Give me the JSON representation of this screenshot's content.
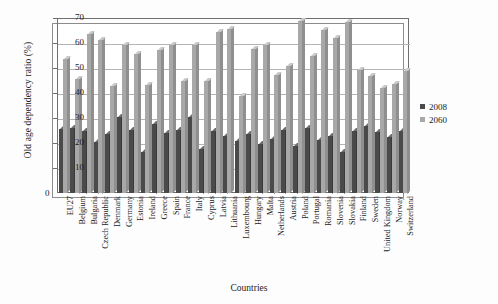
{
  "chart_data": {
    "type": "bar",
    "title": "",
    "xlabel": "Countries",
    "ylabel": "Old age dependency ratio (%)",
    "ylim": [
      0,
      70
    ],
    "ytick_step": 10,
    "yticks": [
      0,
      10,
      20,
      30,
      40,
      50,
      60,
      70
    ],
    "grid": true,
    "legend_position": "right",
    "categories": [
      "EU27",
      "Belgium",
      "Bulgaria",
      "Czech Republic",
      "Denmark",
      "Germany",
      "Estonia",
      "Ireland",
      "Greece",
      "Spain",
      "France",
      "Italy",
      "Cyprus",
      "Latvia",
      "Lithuania",
      "Luxembourg",
      "Hungary",
      "Malta",
      "Netherlands",
      "Austria",
      "Poland",
      "Portugal",
      "Romania",
      "Slovenia",
      "Slovakia",
      "Finland",
      "Sweden",
      "United Kingdom",
      "Norway",
      "Switzerland"
    ],
    "series": [
      {
        "name": "2008",
        "color": "#4a4a4a",
        "values": [
          25.5,
          26.0,
          25.0,
          20.6,
          23.6,
          30.3,
          25.2,
          16.5,
          27.8,
          24.1,
          25.3,
          30.5,
          17.8,
          25.0,
          23.0,
          20.8,
          23.5,
          19.8,
          21.8,
          25.4,
          19.0,
          25.9,
          21.3,
          23.0,
          16.6,
          24.8,
          26.7,
          24.3,
          22.3,
          25.0
        ]
      },
      {
        "name": "2060",
        "color": "#a8a8a8",
        "values": [
          53.5,
          45.8,
          63.5,
          61.4,
          42.7,
          59.1,
          55.6,
          43.3,
          57.1,
          59.1,
          44.7,
          59.1,
          45.0,
          64.6,
          65.7,
          39.0,
          57.6,
          59.1,
          47.2,
          50.7,
          69.0,
          54.8,
          65.3,
          62.2,
          68.5,
          49.3,
          46.7,
          42.1,
          43.7,
          49.0
        ]
      }
    ]
  },
  "legend": {
    "items": [
      {
        "label": "2008"
      },
      {
        "label": "2060"
      }
    ]
  }
}
